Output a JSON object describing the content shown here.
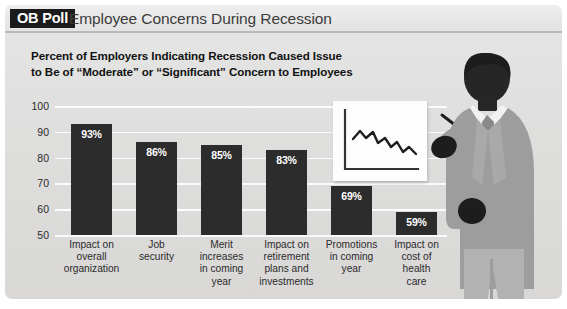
{
  "header": {
    "badge": "OB Poll",
    "title": "Employee Concerns During Recession"
  },
  "chart_data": {
    "type": "bar",
    "title": "Percent of Employers Indicating Recession Caused Issue to Be of “Moderate” or “Significant” Concern to Employees",
    "subtitle_line1": "Percent of Employers Indicating Recession Caused Issue",
    "subtitle_line2": "to Be of “Moderate” or “Significant” Concern to Employees",
    "categories": [
      "Impact on overall organization",
      "Job security",
      "Merit increases in coming year",
      "Impact on retirement plans and investments",
      "Promotions in coming year",
      "Impact on cost of health care"
    ],
    "category_lines": [
      [
        "Impact on",
        "overall",
        "organization"
      ],
      [
        "Job",
        "security"
      ],
      [
        "Merit",
        "increases",
        "in coming",
        "year"
      ],
      [
        "Impact on",
        "retirement",
        "plans and",
        "investments"
      ],
      [
        "Promotions",
        "in coming",
        "year"
      ],
      [
        "Impact on",
        "cost of",
        "health",
        "care"
      ]
    ],
    "values": [
      93,
      86,
      85,
      83,
      69,
      59
    ],
    "value_labels": [
      "93%",
      "86%",
      "85%",
      "83%",
      "69%",
      "59%"
    ],
    "ylim": [
      50,
      100
    ],
    "yticks": [
      100,
      90,
      80,
      70,
      60,
      50
    ],
    "ytick_labels": [
      "100",
      "90",
      "80",
      "70",
      "60",
      "50"
    ],
    "xlabel": "",
    "ylabel": "",
    "grid": true,
    "legend": "none",
    "bar_color": "#2c2c2c",
    "value_label_color": "#ffffff",
    "gridline_color": "#fbfbfb",
    "background_color": "#dedddc"
  },
  "illustration": {
    "board": "presentation-board-with-declining-line-chart",
    "figure": "businessman-silhouette-pointing-with-pen",
    "suit_color": "#9d9d9d",
    "skin_color": "#2a2a2a",
    "shirt_color": "#f2f2f2",
    "tie_color": "#8a8a8a"
  }
}
